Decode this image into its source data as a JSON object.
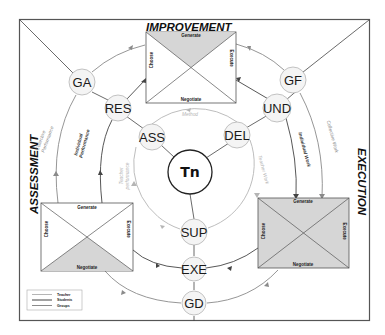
{
  "diagram": {
    "phases": {
      "improvement": "IMPROVEMENT",
      "execution": "EXECUTION",
      "assessment": "ASSESSMENT"
    },
    "center_node": "Tn",
    "nodes": {
      "ass": "ASS",
      "del": "DEL",
      "res": "RES",
      "und": "UND",
      "ga": "GA",
      "gf": "GF",
      "sup": "SUP",
      "exe": "EXE",
      "gd": "GD"
    },
    "box_labels": {
      "generate": "Generate",
      "choose": "Choose",
      "execute": "Execute",
      "negotiate": "Negotiate"
    },
    "arc_labels": {
      "method": "Method",
      "teacher_work": "Teacher Work",
      "teacher_performance_line1": "Teacher",
      "teacher_performance_line2": "performance",
      "individual_work": "Individual Work",
      "collective_work": "Collective Work",
      "individual_performance_line1": "Individual",
      "individual_performance_line2": "Performance",
      "collective_performance_line1": "Collective",
      "collective_performance_line2": "Performance"
    },
    "legend": [
      {
        "label": "Teacher",
        "color": "#b5b5b5"
      },
      {
        "label": "Students",
        "color": "#444444"
      },
      {
        "label": "Groups",
        "color": "#8a8a8a"
      }
    ],
    "colors": {
      "frame": "#555555",
      "teacher_line": "#b5b5b5",
      "student_line": "#444444",
      "group_line": "#8a8a8a",
      "box_shade": "#d6d6d6",
      "node_fill": "#f4f4f4"
    }
  }
}
